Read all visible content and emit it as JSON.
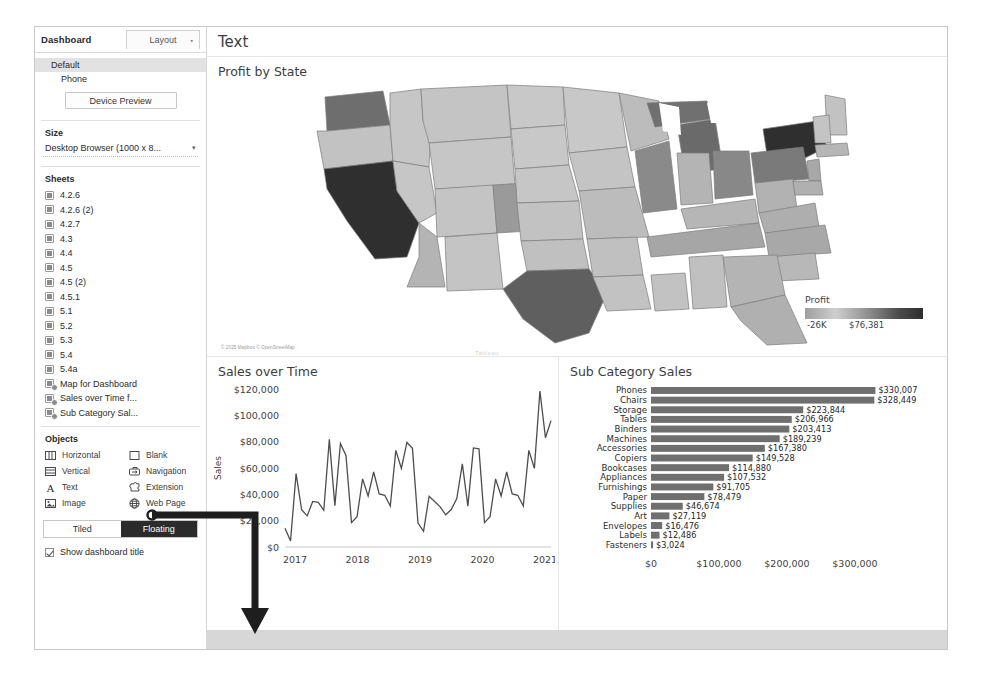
{
  "sidebar": {
    "title": "Dashboard",
    "layout_tab": "Layout",
    "layout_tab_marker": "▪",
    "devices": [
      {
        "label": "Default",
        "selected": true
      },
      {
        "label": "Phone",
        "selected": false
      }
    ],
    "device_preview_label": "Device Preview",
    "size": {
      "heading": "Size",
      "value": "Desktop Browser (1000 x 8...",
      "caret": "▾"
    },
    "sheets": {
      "heading": "Sheets",
      "items": [
        {
          "label": "4.2.6",
          "type": "worksheet"
        },
        {
          "label": "4.2.6 (2)",
          "type": "worksheet"
        },
        {
          "label": "4.2.7",
          "type": "worksheet"
        },
        {
          "label": "4.3",
          "type": "worksheet"
        },
        {
          "label": "4.4",
          "type": "worksheet"
        },
        {
          "label": "4.5",
          "type": "worksheet"
        },
        {
          "label": "4.5 (2)",
          "type": "worksheet"
        },
        {
          "label": "4.5.1",
          "type": "worksheet"
        },
        {
          "label": "5.1",
          "type": "worksheet"
        },
        {
          "label": "5.2",
          "type": "worksheet"
        },
        {
          "label": "5.3",
          "type": "worksheet"
        },
        {
          "label": "5.4",
          "type": "worksheet"
        },
        {
          "label": "5.4a",
          "type": "worksheet"
        },
        {
          "label": "Map for Dashboard",
          "type": "dashboard"
        },
        {
          "label": "Sales over Time f...",
          "type": "dashboard"
        },
        {
          "label": "Sub Category Sal...",
          "type": "dashboard"
        }
      ]
    },
    "objects": {
      "heading": "Objects",
      "items": [
        {
          "label": "Horizontal",
          "icon": "horizontal-container-icon"
        },
        {
          "label": "Blank",
          "icon": "blank-icon"
        },
        {
          "label": "Vertical",
          "icon": "vertical-container-icon"
        },
        {
          "label": "Navigation",
          "icon": "navigation-icon"
        },
        {
          "label": "Text",
          "icon": "text-icon"
        },
        {
          "label": "Extension",
          "icon": "extension-icon"
        },
        {
          "label": "Image",
          "icon": "image-icon"
        },
        {
          "label": "Web Page",
          "icon": "web-page-icon"
        }
      ]
    },
    "tiled_label": "Tiled",
    "floating_label": "Floating",
    "floating_selected": true,
    "show_dashboard_title": "Show dashboard title",
    "show_dashboard_title_checked": true
  },
  "dashboard": {
    "title": "Text",
    "map_panel": {
      "title": "Profit by State"
    },
    "line_panel": {
      "title": "Sales over Time"
    },
    "bar_panel": {
      "title": "Sub Category Sales"
    },
    "map_attribution": "© 2025 Mapbox © OpenStreetMap",
    "watermark": "Tableau"
  },
  "chart_data": [
    {
      "type": "heatmap",
      "title": "Profit by State",
      "legend_title": "Profit",
      "legend_min_label": "-26K",
      "legend_max_label": "$76,381",
      "legend_min": -26000,
      "legend_max": 76381,
      "legend_position": "bottom-right",
      "notable_states": [
        {
          "state": "New York",
          "shade": "darkest"
        },
        {
          "state": "California",
          "shade": "darkest"
        },
        {
          "state": "Texas",
          "shade": "dark"
        },
        {
          "state": "Washington",
          "shade": "dark"
        },
        {
          "state": "Michigan",
          "shade": "dark"
        },
        {
          "state": "Pennsylvania",
          "shade": "dark"
        },
        {
          "state": "Ohio",
          "shade": "dark"
        },
        {
          "state": "Illinois",
          "shade": "dark"
        },
        {
          "state": "Colorado",
          "shade": "mid-dark"
        },
        {
          "state": "Florida",
          "shade": "mid"
        },
        {
          "state": "Arizona",
          "shade": "mid"
        },
        {
          "state": "Tennessee",
          "shade": "mid"
        },
        {
          "state": "North Carolina",
          "shade": "mid"
        },
        {
          "state": "Oregon",
          "shade": "mid"
        }
      ]
    },
    {
      "type": "line",
      "title": "Sales over Time",
      "xlabel": "Month of Order Date",
      "ylabel": "Sales",
      "ylim": [
        0,
        120000
      ],
      "ytick_labels": [
        "$0",
        "$20,000",
        "$40,000",
        "$60,000",
        "$80,000",
        "$100,000",
        "$120,000"
      ],
      "yticks": [
        0,
        20000,
        40000,
        60000,
        80000,
        100000,
        120000
      ],
      "xtick_labels": [
        "2017",
        "2018",
        "2019",
        "2020",
        "2021"
      ],
      "grid": false,
      "x": [
        "2017-01",
        "2017-02",
        "2017-03",
        "2017-04",
        "2017-05",
        "2017-06",
        "2017-07",
        "2017-08",
        "2017-09",
        "2017-10",
        "2017-11",
        "2017-12",
        "2018-01",
        "2018-02",
        "2018-03",
        "2018-04",
        "2018-05",
        "2018-06",
        "2018-07",
        "2018-08",
        "2018-09",
        "2018-10",
        "2018-11",
        "2018-12",
        "2019-01",
        "2019-02",
        "2019-03",
        "2019-04",
        "2019-05",
        "2019-06",
        "2019-07",
        "2019-08",
        "2019-09",
        "2019-10",
        "2019-11",
        "2019-12",
        "2020-01",
        "2020-02",
        "2020-03",
        "2020-04",
        "2020-05",
        "2020-06",
        "2020-07",
        "2020-08",
        "2020-09",
        "2020-10",
        "2020-11",
        "2020-12",
        "2021-01"
      ],
      "values": [
        14236,
        4520,
        55691,
        28295,
        23648,
        34595,
        33946,
        27909,
        81777,
        31453,
        78629,
        69545,
        18542,
        22979,
        51715,
        38750,
        56987,
        40344,
        39262,
        31116,
        73410,
        59688,
        79412,
        74920,
        18174,
        11951,
        38560,
        34596,
        30469,
        24467,
        28463,
        36818,
        63133,
        31013,
        75250,
        74543,
        18542,
        22979,
        51715,
        38750,
        56987,
        40344,
        39262,
        31116,
        73410,
        59688,
        118448,
        83030,
        96000
      ]
    },
    {
      "type": "bar",
      "title": "Sub Category Sales",
      "xlabel": "Sales F",
      "ylabel": "",
      "orientation": "horizontal",
      "xlim": [
        0,
        350000
      ],
      "xtick_labels": [
        "$0",
        "$100,000",
        "$200,000",
        "$300,000"
      ],
      "xticks": [
        0,
        100000,
        200000,
        300000
      ],
      "categories": [
        "Phones",
        "Chairs",
        "Storage",
        "Tables",
        "Binders",
        "Machines",
        "Accessories",
        "Copiers",
        "Bookcases",
        "Appliances",
        "Furnishings",
        "Paper",
        "Supplies",
        "Art",
        "Envelopes",
        "Labels",
        "Fasteners"
      ],
      "values": [
        330007,
        328449,
        223844,
        206966,
        203413,
        189239,
        167380,
        149528,
        114880,
        107532,
        91705,
        78479,
        46674,
        27119,
        16476,
        12486,
        3024
      ],
      "value_labels": [
        "$330,007",
        "$328,449",
        "$223,844",
        "$206,966",
        "$203,413",
        "$189,239",
        "$167,380",
        "$149,528",
        "$114,880",
        "$107,532",
        "$91,705",
        "$78,479",
        "$46,674",
        "$27,119",
        "$16,476",
        "$12,486",
        "$3,024"
      ]
    }
  ],
  "colors": {
    "bar_fill": "#6f6f6f",
    "floating_selected_bg": "#2b2b2b",
    "bottom_strip": "#d7d7d7",
    "map_dark": "#2f2f2f",
    "map_light": "#c8c8c8"
  }
}
